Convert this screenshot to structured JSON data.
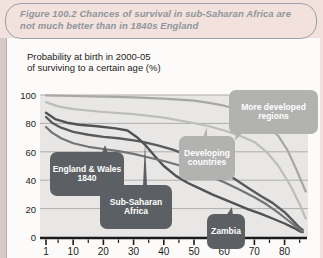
{
  "figure": {
    "title": "Figure 100.2  Chances of survival in sub-Saharan Africa are not much better than in 1840s England"
  },
  "chart": {
    "heading_line1": "Probability at birth in 2000-05",
    "heading_line2": "of surviving to a certain age (%)",
    "callouts": {
      "more_developed": "More developed\nregions",
      "developing": "Developing\ncountries",
      "england_wales": "England & Wales\n1840",
      "sub_saharan": "Sub-Saharan\nAfrica",
      "zambia": "Zambia"
    },
    "colors": {
      "page_pink": "#f2e1dd",
      "panel_white": "#fdfbf9",
      "plot_background": "#e8e7e5",
      "gridline": "#9f9f9f",
      "axis_black": "#1b1b1b",
      "dark_callout": "#5c5f63",
      "light_callout": "#b2b2b0",
      "title_gray": "#8f969c"
    }
  },
  "chart_data": {
    "type": "line",
    "title": "Probability at birth in 2000-05 of surviving to a certain age (%)",
    "xlabel": "age (years)",
    "ylabel": "% surviving",
    "xlim": [
      1,
      88
    ],
    "ylim": [
      0,
      100
    ],
    "x_ticks": [
      1,
      10,
      20,
      30,
      40,
      50,
      60,
      70,
      80
    ],
    "x_minor_ticks": [
      5,
      15,
      25,
      35,
      45,
      55,
      65,
      75,
      85
    ],
    "y_ticks": [
      0,
      20,
      40,
      60,
      80,
      100
    ],
    "grid": "horizontal",
    "legend": "inline-callouts",
    "series": [
      {
        "name": "More developed regions",
        "color": "#a7a7a5",
        "width": 2.2,
        "points": [
          [
            1,
            99.8
          ],
          [
            10,
            99.3
          ],
          [
            20,
            98.8
          ],
          [
            30,
            98.3
          ],
          [
            40,
            97.5
          ],
          [
            50,
            96
          ],
          [
            55,
            94.5
          ],
          [
            60,
            92.5
          ],
          [
            65,
            89.5
          ],
          [
            70,
            85
          ],
          [
            74,
            79.5
          ],
          [
            78,
            71
          ],
          [
            81,
            61
          ],
          [
            84,
            47
          ],
          [
            87,
            32
          ]
        ]
      },
      {
        "name": "Developing countries",
        "color": "#bdbdbb",
        "width": 2.2,
        "points": [
          [
            1,
            95
          ],
          [
            5,
            92
          ],
          [
            10,
            90
          ],
          [
            20,
            88
          ],
          [
            30,
            86.5
          ],
          [
            40,
            84
          ],
          [
            48,
            81
          ],
          [
            55,
            78
          ],
          [
            60,
            75
          ],
          [
            65,
            71.5
          ],
          [
            70,
            67
          ],
          [
            74,
            60
          ],
          [
            78,
            50
          ],
          [
            82,
            36
          ],
          [
            85,
            23
          ],
          [
            87,
            13
          ]
        ]
      },
      {
        "name": "Sub-Saharan Africa",
        "color": "#595a5c",
        "width": 2.4,
        "points": [
          [
            1,
            84.5
          ],
          [
            3,
            80.5
          ],
          [
            6,
            77
          ],
          [
            10,
            74
          ],
          [
            15,
            72
          ],
          [
            20,
            70.5
          ],
          [
            25,
            69.5
          ],
          [
            30,
            68
          ],
          [
            33,
            67
          ],
          [
            38,
            64.5
          ],
          [
            43,
            61.5
          ],
          [
            48,
            57.5
          ],
          [
            53,
            53
          ],
          [
            58,
            47.5
          ],
          [
            63,
            41.5
          ],
          [
            68,
            34.5
          ],
          [
            72,
            29
          ],
          [
            76,
            24
          ],
          [
            80,
            17.5
          ],
          [
            83,
            11
          ],
          [
            85,
            6.5
          ],
          [
            86,
            5
          ]
        ]
      },
      {
        "name": "Zambia",
        "color": "#505254",
        "width": 2.4,
        "points": [
          [
            1,
            87.5
          ],
          [
            4,
            83
          ],
          [
            8,
            80.5
          ],
          [
            12,
            79
          ],
          [
            18,
            78
          ],
          [
            24,
            76.5
          ],
          [
            28,
            75
          ],
          [
            31,
            70.5
          ],
          [
            34,
            64.5
          ],
          [
            37,
            57
          ],
          [
            40,
            50
          ],
          [
            44,
            43
          ],
          [
            48,
            38
          ],
          [
            52,
            34
          ],
          [
            56,
            30
          ],
          [
            60,
            26.5
          ],
          [
            64,
            23
          ],
          [
            68,
            19.5
          ],
          [
            72,
            16.5
          ],
          [
            76,
            13
          ],
          [
            80,
            9.5
          ],
          [
            83,
            6.5
          ],
          [
            85,
            4
          ],
          [
            86,
            3.5
          ]
        ]
      },
      {
        "name": "England & Wales 1840",
        "color": "#737476",
        "width": 2.2,
        "points": [
          [
            1,
            77.5
          ],
          [
            3,
            73.5
          ],
          [
            6,
            69.5
          ],
          [
            10,
            66
          ],
          [
            15,
            63.5
          ],
          [
            20,
            62
          ],
          [
            25,
            60.5
          ],
          [
            30,
            58.5
          ],
          [
            35,
            56
          ],
          [
            40,
            53.5
          ],
          [
            45,
            50.5
          ],
          [
            50,
            47
          ],
          [
            55,
            43
          ],
          [
            60,
            38.5
          ],
          [
            65,
            33.5
          ],
          [
            70,
            28
          ],
          [
            74,
            23
          ],
          [
            78,
            17
          ],
          [
            81,
            12
          ],
          [
            84,
            7
          ],
          [
            86,
            4
          ]
        ]
      }
    ]
  }
}
